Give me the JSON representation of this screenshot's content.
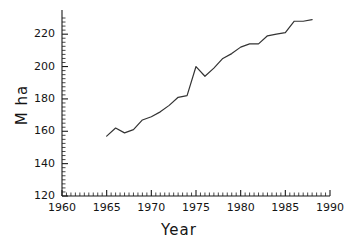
{
  "chart_data": {
    "type": "line",
    "title": "",
    "xlabel": "Year",
    "ylabel": "M ha",
    "xlim": [
      1960,
      1990
    ],
    "ylim": [
      120,
      230
    ],
    "xticks": [
      1960,
      1965,
      1970,
      1975,
      1980,
      1985,
      1990
    ],
    "yticks": [
      120,
      140,
      160,
      180,
      200,
      220
    ],
    "xtick_labels": [
      "1960",
      "1965",
      "1970",
      "1975",
      "1980",
      "1985",
      "1990"
    ],
    "ytick_labels": [
      "120",
      "140",
      "160",
      "180",
      "200",
      "220"
    ],
    "minor_ticks": true,
    "grid": false,
    "legend": false,
    "line_color": "#333333",
    "line_width": 1.2,
    "axis_color": "#1a1a1a",
    "background": "#ffffff",
    "x": [
      1965,
      1966,
      1967,
      1968,
      1969,
      1970,
      1971,
      1972,
      1973,
      1974,
      1975,
      1976,
      1977,
      1978,
      1979,
      1980,
      1981,
      1982,
      1983,
      1984,
      1985,
      1986,
      1987,
      1988
    ],
    "values": [
      157,
      162,
      159,
      161,
      167,
      169,
      172,
      176,
      181,
      182,
      200,
      194,
      199,
      205,
      208,
      212,
      214,
      214,
      219,
      220,
      221,
      228,
      228,
      229
    ],
    "series": [
      {
        "name": "M ha",
        "x": [
          1965,
          1966,
          1967,
          1968,
          1969,
          1970,
          1971,
          1972,
          1973,
          1974,
          1975,
          1976,
          1977,
          1978,
          1979,
          1980,
          1981,
          1982,
          1983,
          1984,
          1985,
          1986,
          1987,
          1988
        ],
        "values": [
          157,
          162,
          159,
          161,
          167,
          169,
          172,
          176,
          181,
          182,
          200,
          194,
          199,
          205,
          208,
          212,
          214,
          214,
          219,
          220,
          221,
          228,
          228,
          229
        ]
      }
    ]
  }
}
